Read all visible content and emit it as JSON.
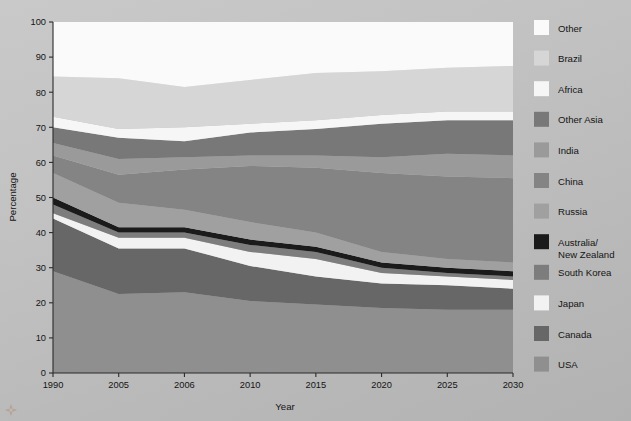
{
  "chart_data": {
    "type": "area",
    "title": "",
    "subtitle": "",
    "xlabel": "Year",
    "ylabel": "Percentage",
    "grid": false,
    "stacked": true,
    "stack_total": 100,
    "legend_position": "right",
    "categories": [
      "1990",
      "2005",
      "2006",
      "2010",
      "2015",
      "2020",
      "2025",
      "2030"
    ],
    "x": [
      1990,
      2005,
      2006,
      2010,
      2015,
      2020,
      2025,
      2030
    ],
    "xlim": [
      1990,
      2030
    ],
    "ylim": [
      0,
      100
    ],
    "ytick_labels": [
      "0",
      "10",
      "20",
      "30",
      "40",
      "50",
      "60",
      "70",
      "80",
      "90",
      "100"
    ],
    "yticks": [
      0,
      10,
      20,
      30,
      40,
      50,
      60,
      70,
      80,
      90,
      100
    ],
    "xtick_labels": [
      "1990",
      "2005",
      "2006",
      "2010",
      "2015",
      "2020",
      "2025",
      "2030"
    ],
    "series": [
      {
        "name": "USA",
        "color": "#8f8f8f",
        "values": [
          29.0,
          22.5,
          23.0,
          20.5,
          19.5,
          18.5,
          18.0,
          18.0
        ],
        "cumulative": [
          29.0,
          22.5,
          23.0,
          20.5,
          19.5,
          18.5,
          18.0,
          18.0
        ]
      },
      {
        "name": "Canada",
        "color": "#676767",
        "values": [
          15.0,
          13.0,
          12.5,
          10.0,
          8.0,
          7.0,
          7.0,
          6.0
        ],
        "cumulative": [
          44.0,
          35.5,
          35.5,
          30.5,
          27.5,
          25.5,
          25.0,
          24.0
        ]
      },
      {
        "name": "Japan",
        "color": "#f2f2f2",
        "values": [
          1.5,
          3.0,
          3.0,
          4.0,
          5.0,
          3.0,
          2.5,
          2.5
        ],
        "cumulative": [
          45.5,
          38.5,
          38.5,
          34.5,
          32.5,
          28.5,
          27.5,
          26.5
        ]
      },
      {
        "name": "South Korea",
        "color": "#7d7d7d",
        "values": [
          2.5,
          1.5,
          1.5,
          2.0,
          2.0,
          1.5,
          1.0,
          1.0
        ],
        "cumulative": [
          48.0,
          40.0,
          40.0,
          36.5,
          34.5,
          30.0,
          28.5,
          27.5
        ]
      },
      {
        "name": "Australia/New Zealand",
        "color": "#1b1b1b",
        "values": [
          2.0,
          1.5,
          1.5,
          1.5,
          1.5,
          1.5,
          1.5,
          1.5
        ],
        "cumulative": [
          50.0,
          41.5,
          41.5,
          38.0,
          36.0,
          31.5,
          30.0,
          29.0
        ]
      },
      {
        "name": "Russia",
        "color": "#a0a0a0",
        "values": [
          7.0,
          7.0,
          5.0,
          5.0,
          4.0,
          3.0,
          2.5,
          2.5
        ],
        "cumulative": [
          57.0,
          48.5,
          46.5,
          43.0,
          40.0,
          34.5,
          32.5,
          31.5
        ]
      },
      {
        "name": "China",
        "color": "#848484",
        "values": [
          5.0,
          8.0,
          11.5,
          16.0,
          18.5,
          22.5,
          23.5,
          24.0
        ],
        "cumulative": [
          62.0,
          56.5,
          58.0,
          59.0,
          58.5,
          57.0,
          56.0,
          55.5
        ]
      },
      {
        "name": "India",
        "color": "#9a9a9a",
        "values": [
          3.5,
          4.5,
          3.5,
          3.0,
          3.5,
          4.5,
          6.5,
          6.5
        ],
        "cumulative": [
          65.5,
          61.0,
          61.5,
          62.0,
          62.0,
          61.5,
          62.5,
          62.0
        ]
      },
      {
        "name": "Other Asia",
        "color": "#787878",
        "values": [
          4.5,
          6.0,
          4.5,
          6.5,
          7.5,
          9.5,
          9.5,
          10.0
        ],
        "cumulative": [
          70.0,
          67.0,
          66.0,
          68.5,
          69.5,
          71.0,
          72.0,
          72.0
        ]
      },
      {
        "name": "Africa",
        "color": "#f6f6f6",
        "values": [
          3.0,
          2.5,
          4.0,
          2.5,
          2.5,
          2.5,
          2.5,
          2.5
        ],
        "cumulative": [
          73.0,
          69.5,
          70.0,
          71.0,
          72.0,
          73.5,
          74.5,
          74.5
        ]
      },
      {
        "name": "Brazil",
        "color": "#d6d6d6",
        "values": [
          11.5,
          14.5,
          11.5,
          12.5,
          13.5,
          12.5,
          12.5,
          13.0
        ],
        "cumulative": [
          84.5,
          84.0,
          81.5,
          83.5,
          85.5,
          86.0,
          87.0,
          87.5
        ]
      },
      {
        "name": "Other",
        "color": "#fafafa",
        "values": [
          15.5,
          16.0,
          18.5,
          16.5,
          14.5,
          14.0,
          13.0,
          12.5
        ],
        "cumulative": [
          100.0,
          100.0,
          100.0,
          100.0,
          100.0,
          100.0,
          100.0,
          100.0
        ]
      }
    ],
    "legend_order": [
      "Other",
      "Brazil",
      "Africa",
      "Other Asia",
      "India",
      "China",
      "Russia",
      "Australia/New Zealand",
      "South Korea",
      "Japan",
      "Canada",
      "USA"
    ]
  },
  "legend": {
    "items": [
      {
        "label": "Other",
        "label2": "",
        "color": "#fafafa"
      },
      {
        "label": "Brazil",
        "label2": "",
        "color": "#d6d6d6"
      },
      {
        "label": "Africa",
        "label2": "",
        "color": "#f6f6f6"
      },
      {
        "label": "Other Asia",
        "label2": "",
        "color": "#787878"
      },
      {
        "label": "India",
        "label2": "",
        "color": "#9a9a9a"
      },
      {
        "label": "China",
        "label2": "",
        "color": "#848484"
      },
      {
        "label": "Russia",
        "label2": "",
        "color": "#a0a0a0"
      },
      {
        "label": "Australia/",
        "label2": "New Zealand",
        "color": "#1b1b1b"
      },
      {
        "label": "South Korea",
        "label2": "",
        "color": "#7d7d7d"
      },
      {
        "label": "Japan",
        "label2": "",
        "color": "#f2f2f2"
      },
      {
        "label": "Canada",
        "label2": "",
        "color": "#676767"
      },
      {
        "label": "USA",
        "label2": "",
        "color": "#8f8f8f"
      }
    ]
  },
  "axes": {
    "y_title": "Percentage",
    "x_title": "Year"
  },
  "colors": {
    "background_top": "#c9c9c9",
    "background_bottom": "#b2b2b2",
    "axis": "#2b2b2b",
    "text": "#141414"
  }
}
